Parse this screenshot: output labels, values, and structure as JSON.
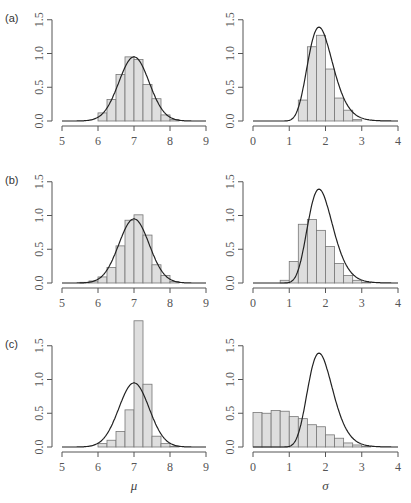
{
  "chart_data": [
    {
      "panel": "(a)",
      "param": "mu",
      "type": "bar",
      "xlim": [
        5,
        9
      ],
      "ylim": [
        0,
        1.5
      ],
      "bin_width": 0.25,
      "bin_start": 6.0,
      "values": [
        0.12,
        0.32,
        0.69,
        0.95,
        0.91,
        0.54,
        0.33,
        0.09,
        0.02
      ],
      "curve": {
        "type": "normal",
        "mean": 7.0,
        "sd": 0.42,
        "peak": 0.95
      },
      "xticks": [
        "5",
        "6",
        "7",
        "8",
        "9"
      ],
      "yticks": [
        "0.0",
        "0.5",
        "1.0",
        "1.5"
      ]
    },
    {
      "panel": "(a)",
      "param": "sigma",
      "type": "bar",
      "xlim": [
        0,
        4
      ],
      "ylim": [
        0,
        1.5
      ],
      "bin_width": 0.25,
      "bin_start": 1.25,
      "values": [
        0.31,
        1.1,
        1.27,
        0.77,
        0.34,
        0.16,
        0.02
      ],
      "curve": {
        "type": "skewed",
        "mode": 1.82,
        "peak": 1.39
      },
      "xticks": [
        "0",
        "1",
        "2",
        "3",
        "4"
      ],
      "yticks": [
        "0.0",
        "0.5",
        "1.0",
        "1.5"
      ]
    },
    {
      "panel": "(b)",
      "param": "mu",
      "type": "bar",
      "xlim": [
        5,
        9
      ],
      "ylim": [
        0,
        1.5
      ],
      "bin_width": 0.25,
      "bin_start": 5.5,
      "values": [
        0.01,
        0.03,
        0.09,
        0.23,
        0.55,
        0.93,
        1.01,
        0.71,
        0.27,
        0.11,
        0.02
      ],
      "curve": {
        "type": "normal",
        "mean": 7.0,
        "sd": 0.42,
        "peak": 0.95
      },
      "xticks": [
        "5",
        "6",
        "7",
        "8",
        "9"
      ],
      "yticks": [
        "0.0",
        "0.5",
        "1.0",
        "1.5"
      ]
    },
    {
      "panel": "(b)",
      "param": "sigma",
      "type": "bar",
      "xlim": [
        0,
        4
      ],
      "ylim": [
        0,
        1.5
      ],
      "bin_width": 0.25,
      "bin_start": 0.75,
      "values": [
        0.04,
        0.32,
        0.87,
        0.94,
        0.78,
        0.54,
        0.29,
        0.11,
        0.04,
        0.01
      ],
      "curve": {
        "type": "skewed",
        "mode": 1.82,
        "peak": 1.39
      },
      "xticks": [
        "0",
        "1",
        "2",
        "3",
        "4"
      ],
      "yticks": [
        "0.0",
        "0.5",
        "1.0",
        "1.5"
      ]
    },
    {
      "panel": "(c)",
      "param": "mu",
      "type": "bar",
      "xlim": [
        5,
        9
      ],
      "ylim": [
        0,
        1.5
      ],
      "bin_width": 0.25,
      "bin_start": 6.0,
      "values": [
        0.05,
        0.1,
        0.23,
        0.55,
        1.87,
        0.93,
        0.16,
        0.05,
        0.01
      ],
      "curve": {
        "type": "normal",
        "mean": 7.0,
        "sd": 0.42,
        "peak": 0.95
      },
      "xticks": [
        "5",
        "6",
        "7",
        "8",
        "9"
      ],
      "yticks": [
        "0.0",
        "0.5",
        "1.0",
        "1.5"
      ],
      "xlabel": "μ"
    },
    {
      "panel": "(c)",
      "param": "sigma",
      "type": "bar",
      "xlim": [
        0,
        4
      ],
      "ylim": [
        0,
        1.5
      ],
      "bin_width": 0.25,
      "bin_start": 0.0,
      "values": [
        0.51,
        0.5,
        0.54,
        0.53,
        0.45,
        0.42,
        0.33,
        0.3,
        0.18,
        0.13,
        0.06,
        0.03,
        0.01
      ],
      "curve": {
        "type": "skewed",
        "mode": 1.82,
        "peak": 1.39
      },
      "xticks": [
        "0",
        "1",
        "2",
        "3",
        "4"
      ],
      "yticks": [
        "0.0",
        "0.5",
        "1.0",
        "1.5"
      ],
      "xlabel": "σ"
    }
  ],
  "panel_labels": [
    "(a)",
    "(b)",
    "(c)"
  ],
  "colors": {
    "bar_fill": "#dedede",
    "bar_edge": "#777777",
    "curve": "#222222",
    "axis": "#555555"
  }
}
